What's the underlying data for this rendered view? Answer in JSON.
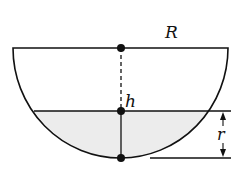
{
  "diagram": {
    "labels": {
      "R": "R",
      "h": "h",
      "r": "r"
    },
    "colors": {
      "stroke": "#111111",
      "fill_liquid": "#ececec",
      "background": "#ffffff"
    },
    "points": [
      {
        "name": "top-center",
        "x": 121,
        "y": 48
      },
      {
        "name": "surface-center",
        "x": 121,
        "y": 111
      },
      {
        "name": "bottom",
        "x": 121,
        "y": 158
      }
    ]
  }
}
